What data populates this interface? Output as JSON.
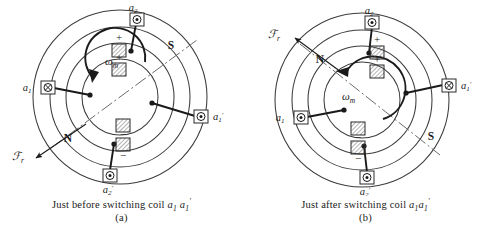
{
  "figure": {
    "panes": [
      {
        "id": "a",
        "caption_prefix": "Just before switching coil",
        "caption_coil_1": "a",
        "caption_coil_1_sub": "1",
        "caption_coil_2": "a",
        "caption_coil_2_sub": "1",
        "caption_coil_2_prime": "′",
        "caption_tag": "(a)",
        "pole_north_label": "N",
        "pole_south_label": "S",
        "mmf_label": "ℱ",
        "mmf_sub": "r",
        "omega_label": "ω",
        "omega_sub": "m",
        "terminals": [
          {
            "name": "a2",
            "label": "a",
            "sub": "2",
            "prime": "",
            "symbol": "circled-dot",
            "position": "top"
          },
          {
            "name": "a1",
            "label": "a",
            "sub": "1",
            "prime": "",
            "symbol": "circled-cross",
            "position": "left"
          },
          {
            "name": "a1prime",
            "label": "a",
            "sub": "1",
            "prime": "′",
            "symbol": "circled-dot",
            "position": "right"
          },
          {
            "name": "a2prime",
            "label": "a",
            "sub": "2",
            "prime": "′",
            "symbol": "circled-dot",
            "position": "bottom"
          }
        ],
        "conductor_signs": [
          "+",
          "+",
          "−",
          "−"
        ],
        "mmf_angle_deg": 217,
        "pole_axis_angle_deg": 37
      },
      {
        "id": "b",
        "caption_prefix": "Just after switching coil",
        "caption_coil_1": "a",
        "caption_coil_1_sub": "1",
        "caption_coil_2": "a",
        "caption_coil_2_sub": "1",
        "caption_coil_2_prime": "′",
        "caption_tag": "(b)",
        "pole_north_label": "N",
        "pole_south_label": "S",
        "mmf_label": "ℱ",
        "mmf_sub": "r",
        "omega_label": "ω",
        "omega_sub": "m",
        "terminals": [
          {
            "name": "a2",
            "label": "a",
            "sub": "2",
            "prime": "",
            "symbol": "circled-dot",
            "position": "top"
          },
          {
            "name": "a1",
            "label": "a",
            "sub": "1",
            "prime": "",
            "symbol": "circled-dot",
            "position": "left"
          },
          {
            "name": "a1prime",
            "label": "a",
            "sub": "1",
            "prime": "′",
            "symbol": "circled-cross",
            "position": "right"
          },
          {
            "name": "a2prime",
            "label": "a",
            "sub": "2",
            "prime": "′",
            "symbol": "circled-dot",
            "position": "bottom"
          }
        ],
        "conductor_signs": [
          "+",
          "+",
          "−",
          "−"
        ],
        "mmf_angle_deg": 143,
        "pole_axis_angle_deg": 323
      }
    ],
    "colors": {
      "ink": "#1a1a1a",
      "line": "#3c3c3c",
      "hatch": "#555555",
      "background": "#ffffff"
    }
  }
}
